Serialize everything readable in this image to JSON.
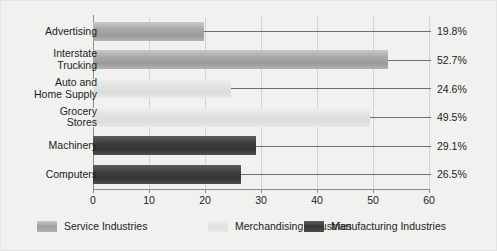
{
  "chart_data": {
    "type": "bar",
    "orientation": "horizontal",
    "title": "",
    "xlabel": "",
    "ylabel": "",
    "xlim": [
      0,
      60
    ],
    "grid": true,
    "xticks": [
      "0",
      "10",
      "20",
      "30",
      "40",
      "50",
      "60"
    ],
    "categories": [
      "Advertising",
      "Interstate\nTrucking",
      "Auto and\nHome Supply",
      "Grocery\nStores",
      "Machinery",
      "Computers"
    ],
    "values": [
      19.8,
      52.7,
      24.6,
      49.5,
      29.1,
      26.5
    ],
    "value_labels": [
      "19.8%",
      "52.7%",
      "24.6%",
      "49.5%",
      "29.1%",
      "26.5%"
    ],
    "series_of_bar": [
      "service",
      "service",
      "merchandising",
      "merchandising",
      "manufacturing",
      "manufacturing"
    ],
    "legend": {
      "position": "bottom",
      "entries": [
        {
          "key": "service",
          "label": "Service Industries"
        },
        {
          "key": "merchandising",
          "label": "Merchandising Industries"
        },
        {
          "key": "manufacturing",
          "label": "Manufacturing Industries"
        }
      ]
    },
    "colors": {
      "service": "#a8a8a6",
      "merchandising": "#e2e2e0",
      "manufacturing": "#3f3f3d",
      "background": "#f1f1ef",
      "axis": "#8d8d8d",
      "gridline": "#d2d2d0",
      "text": "#1c1c1c"
    }
  }
}
